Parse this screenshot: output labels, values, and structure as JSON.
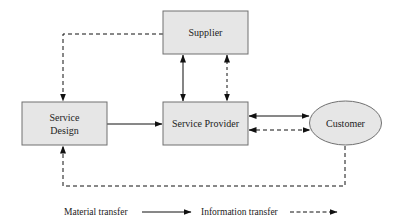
{
  "diagram": {
    "nodes": {
      "supplier": {
        "label": "Supplier",
        "shape": "rectangle"
      },
      "service_design": {
        "label_line1": "Service",
        "label_line2": "Design",
        "shape": "rectangle"
      },
      "service_provider": {
        "label": "Service Provider",
        "shape": "rectangle"
      },
      "customer": {
        "label": "Customer",
        "shape": "ellipse"
      }
    },
    "edges": [
      {
        "from": "Supplier",
        "to": "Service Design",
        "type": "information",
        "style": "dashed",
        "direction": "one-way"
      },
      {
        "from": "Supplier",
        "to": "Service Provider",
        "type": "material",
        "style": "solid",
        "direction": "two-way"
      },
      {
        "from": "Supplier",
        "to": "Service Provider",
        "type": "information",
        "style": "dashed",
        "direction": "two-way"
      },
      {
        "from": "Service Design",
        "to": "Service Provider",
        "type": "material",
        "style": "solid",
        "direction": "one-way"
      },
      {
        "from": "Service Provider",
        "to": "Customer",
        "type": "material",
        "style": "solid",
        "direction": "two-way"
      },
      {
        "from": "Service Provider",
        "to": "Customer",
        "type": "information",
        "style": "dashed",
        "direction": "two-way"
      },
      {
        "from": "Customer",
        "to": "Service Design",
        "type": "information",
        "style": "dashed",
        "direction": "one-way"
      }
    ],
    "legend": {
      "material": "Material transfer",
      "information": "Information transfer"
    },
    "colors": {
      "node_fill": "#e6e6e6",
      "node_stroke": "#707070",
      "line": "#111111"
    }
  }
}
